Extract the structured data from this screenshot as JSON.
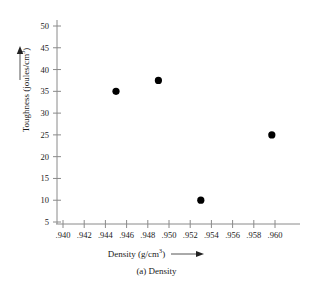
{
  "chart_data": {
    "type": "scatter",
    "title": "",
    "caption": "(a) Density",
    "xlabel": "Density (g/cm",
    "xlabel_sup": "3",
    "xlabel_tail": ")",
    "ylabel": "Toughness (joules/cm",
    "ylabel_sup": "3",
    "ylabel_tail": ")",
    "xlim": [
      0.9395,
      0.9605
    ],
    "ylim": [
      4.0,
      51.5
    ],
    "xticks": [
      0.94,
      0.942,
      0.944,
      0.946,
      0.948,
      0.95,
      0.952,
      0.954,
      0.956,
      0.958,
      0.96
    ],
    "xtick_labels": [
      ".940",
      ".942",
      ".944",
      ".946",
      ".948",
      ".950",
      ".952",
      ".954",
      ".956",
      ".958",
      ".960"
    ],
    "yticks": [
      5,
      10,
      15,
      20,
      25,
      30,
      35,
      40,
      45,
      50
    ],
    "ytick_labels": [
      "5",
      "10",
      "15",
      "20",
      "25",
      "30",
      "35",
      "40",
      "45",
      "50"
    ],
    "grid": false,
    "legend": null,
    "marker": "filled-circle",
    "marker_color": "#000000",
    "axis_color": "#8a8a8a",
    "points": [
      {
        "x": 0.945,
        "y": 35.0
      },
      {
        "x": 0.949,
        "y": 37.5
      },
      {
        "x": 0.953,
        "y": 10.0
      },
      {
        "x": 0.9597,
        "y": 25.0
      }
    ],
    "x_arrow": true,
    "y_arrow": true
  }
}
